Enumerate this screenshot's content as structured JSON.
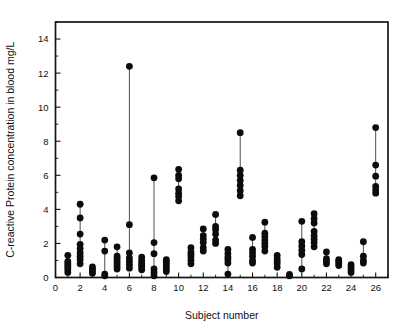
{
  "chart_data": {
    "type": "scatter",
    "title": "",
    "xlabel": "Subject number",
    "ylabel": "C-reactive Protein concentration in blood mg/L",
    "xlim": [
      0,
      27
    ],
    "ylim": [
      0,
      15
    ],
    "xticks": [
      0,
      2,
      4,
      6,
      8,
      10,
      12,
      14,
      16,
      18,
      20,
      22,
      24,
      26
    ],
    "yticks": [
      0,
      2,
      4,
      6,
      8,
      10,
      12,
      14
    ],
    "xtick_labels": [
      "0",
      "2",
      "4",
      "6",
      "8",
      "10",
      "12",
      "14",
      "16",
      "18",
      "20",
      "22",
      "24",
      "26"
    ],
    "ytick_labels": [
      "0",
      "2",
      "4",
      "6",
      "8",
      "10",
      "12",
      "14"
    ],
    "minor_tick_step": 1,
    "grid": false,
    "legend": null,
    "marker": "filled-circle",
    "marker_color": "#0c0c0c",
    "stem_color": "#3b3b3b",
    "frame_color": "#141414",
    "background": "#ffffff",
    "note": "Each subject number has repeated measurements plotted as a vertical strip of filled circles joined by a thin connecting line.",
    "series": [
      {
        "name": "Subject 1",
        "x": 1,
        "values": [
          0.3,
          0.45,
          0.58,
          0.7,
          0.82,
          0.95,
          1.3
        ]
      },
      {
        "name": "Subject 2",
        "x": 2,
        "values": [
          0.8,
          1.05,
          1.25,
          1.45,
          1.7,
          1.95,
          2.55,
          3.5,
          4.3
        ]
      },
      {
        "name": "Subject 3",
        "x": 3,
        "values": [
          0.25,
          0.38,
          0.5,
          0.62
        ]
      },
      {
        "name": "Subject 4",
        "x": 4,
        "values": [
          0.1,
          0.2,
          1.55,
          2.2
        ]
      },
      {
        "name": "Subject 5",
        "x": 5,
        "values": [
          0.5,
          0.65,
          0.8,
          0.95,
          1.1,
          1.25,
          1.8
        ]
      },
      {
        "name": "Subject 6",
        "x": 6,
        "values": [
          0.55,
          0.75,
          0.95,
          1.15,
          1.45,
          3.1,
          12.4
        ]
      },
      {
        "name": "Subject 7",
        "x": 7,
        "values": [
          0.45,
          0.58,
          0.72,
          0.85,
          1.0,
          1.2
        ]
      },
      {
        "name": "Subject 8",
        "x": 8,
        "values": [
          0.1,
          0.3,
          0.5,
          1.4,
          2.05,
          5.85
        ]
      },
      {
        "name": "Subject 9",
        "x": 9,
        "values": [
          0.35,
          0.5,
          0.65,
          0.8,
          0.95,
          1.05
        ]
      },
      {
        "name": "Subject 10",
        "x": 10,
        "values": [
          4.5,
          4.75,
          4.95,
          5.2,
          5.8,
          6.0,
          6.35
        ]
      },
      {
        "name": "Subject 11",
        "x": 11,
        "values": [
          0.8,
          1.0,
          1.2,
          1.35,
          1.5,
          1.75
        ]
      },
      {
        "name": "Subject 12",
        "x": 12,
        "values": [
          1.55,
          1.75,
          2.05,
          2.25,
          2.45,
          2.85
        ]
      },
      {
        "name": "Subject 13",
        "x": 13,
        "values": [
          2.0,
          2.2,
          2.55,
          2.8,
          3.0,
          3.7
        ]
      },
      {
        "name": "Subject 14",
        "x": 14,
        "values": [
          0.2,
          0.85,
          1.05,
          1.2,
          1.4,
          1.65
        ]
      },
      {
        "name": "Subject 15",
        "x": 15,
        "values": [
          4.8,
          5.1,
          5.4,
          5.7,
          6.0,
          6.3,
          8.5
        ]
      },
      {
        "name": "Subject 16",
        "x": 16,
        "values": [
          0.85,
          1.0,
          1.25,
          1.45,
          1.65,
          2.35
        ]
      },
      {
        "name": "Subject 17",
        "x": 17,
        "values": [
          1.55,
          1.8,
          2.0,
          2.2,
          2.4,
          2.6,
          3.25
        ]
      },
      {
        "name": "Subject 18",
        "x": 18,
        "values": [
          0.6,
          0.8,
          0.95,
          1.1,
          1.3
        ]
      },
      {
        "name": "Subject 19",
        "x": 19,
        "values": [
          0.1,
          0.18
        ]
      },
      {
        "name": "Subject 20",
        "x": 20,
        "values": [
          0.5,
          1.35,
          1.6,
          1.85,
          2.1,
          3.3
        ]
      },
      {
        "name": "Subject 21",
        "x": 21,
        "values": [
          1.8,
          2.05,
          2.25,
          2.45,
          2.7,
          3.2,
          3.45,
          3.75
        ]
      },
      {
        "name": "Subject 22",
        "x": 22,
        "values": [
          0.8,
          0.95,
          1.1,
          1.5
        ]
      },
      {
        "name": "Subject 23",
        "x": 23,
        "values": [
          0.7,
          0.82,
          0.95,
          1.05
        ]
      },
      {
        "name": "Subject 24",
        "x": 24,
        "values": [
          0.3,
          0.45,
          0.6,
          0.75
        ]
      },
      {
        "name": "Subject 25",
        "x": 25,
        "values": [
          0.85,
          1.0,
          1.25,
          2.1
        ]
      },
      {
        "name": "Subject 26",
        "x": 26,
        "values": [
          4.95,
          5.15,
          5.35,
          5.95,
          6.6,
          8.8
        ]
      }
    ]
  }
}
